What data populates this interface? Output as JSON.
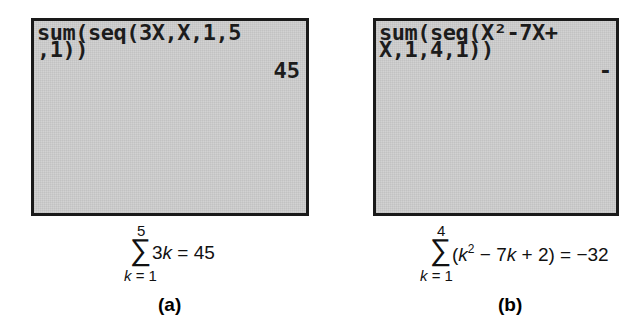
{
  "panels": [
    {
      "id": "a",
      "screen": {
        "lines": [
          "sum(seq(3X,X,1,5",
          ",1))"
        ],
        "result": "45"
      },
      "formula": {
        "upper": "5",
        "sigma": "∑",
        "lower_var": "k",
        "lower_eq": " = 1",
        "expr_pre": "3",
        "expr_var": "k",
        "expr_post": " = 45"
      },
      "caption": "(a)"
    },
    {
      "id": "b",
      "screen": {
        "lines": [
          "sum(seq(X²-7X+",
          "X,1,4,1))"
        ],
        "result": "-"
      },
      "formula": {
        "upper": "4",
        "sigma": "∑",
        "lower_var": "k",
        "lower_eq": " = 1",
        "expr_open": "(",
        "expr_var1": "k",
        "expr_sup": "2",
        "expr_mid": " − 7",
        "expr_var2": "k",
        "expr_post": " + 2) = −32"
      },
      "caption": "(b)"
    }
  ],
  "colors": {
    "screen_bg": "#d2d2d2",
    "screen_border": "#1a1a1a",
    "text": "#111111"
  }
}
